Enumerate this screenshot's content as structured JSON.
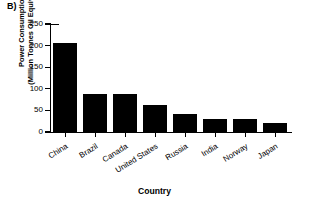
{
  "panel": {
    "label": "B)"
  },
  "chart_data": {
    "type": "bar",
    "title": "",
    "subtitle": "",
    "panel_label": "B)",
    "xlabel": "Country",
    "ylabel": "Power Consumption (Million Tonnes Oil Equivalent)",
    "ylabel_lines": [
      "Power Consumption",
      "(Million Tonnes Oil Equivalent)"
    ],
    "categories": [
      "China",
      "Brazil",
      "Canada",
      "United States",
      "Russia",
      "India",
      "Norway",
      "Japan"
    ],
    "values": [
      207,
      87,
      89,
      62,
      42,
      31,
      30,
      20
    ],
    "ylim": [
      0,
      250
    ],
    "yticks": [
      0,
      50,
      100,
      150,
      200,
      250
    ],
    "ytick_labels": [
      "0",
      "50",
      "100",
      "150",
      "200",
      "250"
    ],
    "grid": false,
    "legend": null,
    "bar_color": "#000000",
    "background_color": "#ffffff",
    "axis_color": "#000000",
    "series": [
      {
        "name": "Power Consumption",
        "values": [
          207,
          87,
          89,
          62,
          42,
          31,
          30,
          20
        ]
      }
    ]
  }
}
